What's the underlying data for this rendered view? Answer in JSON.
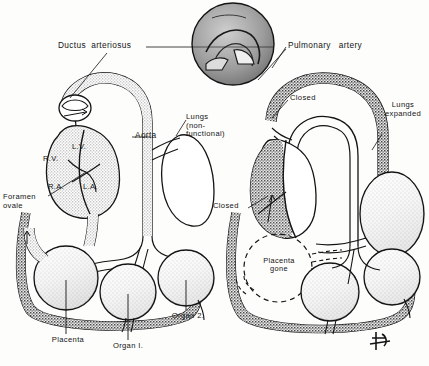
{
  "figure": {
    "background_color": "#fdfdfc",
    "ink_color": "#141414",
    "stipple_color": "#9a9a9a",
    "vessel_fill_light": "#d8d8d8",
    "vessel_fill_dark": "#4a4a4a"
  },
  "panels": {
    "left": {
      "name": "fetal-circulation-panel",
      "labels": {
        "ductus_arteriosus": "Ductus  arteriosus",
        "aorta": "Aorta",
        "lungs": "Lungs\n(non-\nfunctional)",
        "right_ventricle": "R.V.",
        "left_ventricle": "L.V.",
        "right_atrium": "R.A.",
        "left_atrium": "L.A.",
        "foramen_ovale": "Foramen\novale",
        "placenta": "Placenta",
        "organ_1": "Organ I.",
        "organ_2": "Organ 2."
      }
    },
    "right": {
      "name": "postnatal-circulation-panel",
      "labels": {
        "pulmonary_artery": "Pulmonary   artery",
        "closed_upper": "Closed",
        "closed_lower": "Closed",
        "lungs_expanded": "Lungs\nexpanded",
        "placenta_gone": "Placenta\ngone"
      }
    }
  },
  "inset": {
    "name": "ductus-arteriosus-detail-inset",
    "description": "magnified circular detail of ductus arteriosus"
  },
  "signature": {
    "monogram": "artist-monogram"
  }
}
